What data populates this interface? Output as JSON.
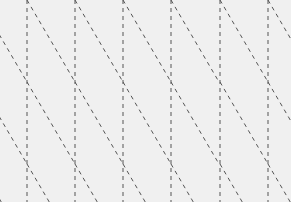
{
  "pattern": {
    "width": 291,
    "height": 202,
    "background": "#f0f0f0",
    "line_color": "#555555",
    "dash": "4 4",
    "stroke_width": 1,
    "vertical_lines_x": [
      27,
      75,
      123,
      171,
      220,
      268
    ],
    "diagonal_period_y": 82,
    "diagonal_dx": 48
  }
}
